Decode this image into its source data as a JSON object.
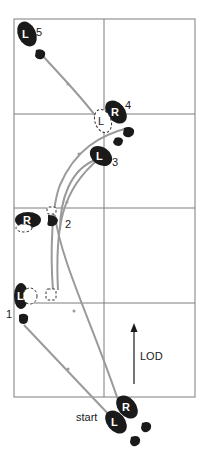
{
  "diagram": {
    "title": "",
    "step_numbers": [
      "1",
      "2",
      "3",
      "4",
      "5"
    ],
    "start_label": "start",
    "direction_label": "LOD",
    "foot_labels": {
      "left": "L",
      "right": "R"
    },
    "footprints": [
      {
        "step": "start",
        "foot": "L",
        "label": "L",
        "style": "solid"
      },
      {
        "step": "start",
        "foot": "R",
        "label": "R",
        "style": "solid"
      },
      {
        "step": "1",
        "foot": "L",
        "label": "L",
        "style": "solid"
      },
      {
        "step": "2",
        "foot": "R",
        "label": "R",
        "style": "solid"
      },
      {
        "step": "3",
        "foot": "L",
        "label": "L",
        "style": "solid"
      },
      {
        "step": "4",
        "foot": "R",
        "label": "R",
        "style": "solid"
      },
      {
        "step": "4",
        "foot": "L",
        "label": "L",
        "style": "dashed"
      },
      {
        "step": "5",
        "foot": "L",
        "label": "L",
        "style": "solid"
      }
    ],
    "grid": {
      "columns": 2,
      "rows": 4
    },
    "colors": {
      "foot": "#1a1a1a",
      "path": "#9a9a9a",
      "grid": "#7d7d7d",
      "background": "#ffffff"
    }
  }
}
